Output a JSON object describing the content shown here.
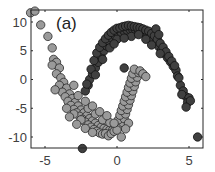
{
  "chart_data": {
    "type": "scatter",
    "title": "",
    "panel_label": "(a)",
    "xlabel": "",
    "ylabel": "",
    "xlim": [
      -6.0,
      6.0
    ],
    "ylim": [
      -12.0,
      12.3
    ],
    "xticks": [
      -5,
      0,
      5
    ],
    "xtick_labels": [
      "-5",
      "0",
      "5"
    ],
    "yticks": [
      -10,
      -5,
      0,
      5,
      10
    ],
    "ytick_labels": [
      "-10",
      "-5",
      "0",
      "5",
      "10"
    ],
    "grid": false,
    "legend": null,
    "marker": "circle",
    "series": [
      {
        "name": "class-1-light",
        "color": "#9a9a9a",
        "edgecolor": "#2a2a2a",
        "points": [
          [
            -6.0,
            11.6
          ],
          [
            -5.7,
            11.9
          ],
          [
            -5.3,
            9.5
          ],
          [
            -4.8,
            7.5
          ],
          [
            -4.5,
            5.5
          ],
          [
            -4.4,
            3.5
          ],
          [
            -4.2,
            3.0
          ],
          [
            -4.5,
            2.5
          ],
          [
            -4.0,
            2.0
          ],
          [
            -4.2,
            1.0
          ],
          [
            -3.9,
            0.3
          ],
          [
            -3.7,
            -0.5
          ],
          [
            -4.0,
            -1.0
          ],
          [
            -3.5,
            -1.5
          ],
          [
            -3.8,
            -2.2
          ],
          [
            -3.3,
            -2.5
          ],
          [
            -3.6,
            -3.0
          ],
          [
            -3.1,
            -3.3
          ],
          [
            -3.4,
            -3.8
          ],
          [
            -2.9,
            -4.0
          ],
          [
            -3.2,
            -4.5
          ],
          [
            -2.7,
            -4.6
          ],
          [
            -3.0,
            -5.2
          ],
          [
            -2.5,
            -5.3
          ],
          [
            -2.8,
            -5.8
          ],
          [
            -2.3,
            -5.8
          ],
          [
            -2.6,
            -6.4
          ],
          [
            -2.1,
            -6.3
          ],
          [
            -2.4,
            -6.9
          ],
          [
            -1.9,
            -6.8
          ],
          [
            -2.2,
            -7.4
          ],
          [
            -1.7,
            -7.2
          ],
          [
            -2.0,
            -7.9
          ],
          [
            -1.5,
            -7.6
          ],
          [
            -1.8,
            -8.3
          ],
          [
            -1.3,
            -8.0
          ],
          [
            -1.6,
            -8.7
          ],
          [
            -1.1,
            -8.3
          ],
          [
            -1.4,
            -9.0
          ],
          [
            -0.9,
            -8.5
          ],
          [
            -1.2,
            -9.3
          ],
          [
            -0.7,
            -8.7
          ],
          [
            -1.0,
            -9.5
          ],
          [
            -0.5,
            -8.8
          ],
          [
            -0.8,
            -9.4
          ],
          [
            -0.3,
            -8.8
          ],
          [
            -0.6,
            -9.8
          ],
          [
            -0.1,
            -8.6
          ],
          [
            -0.4,
            -9.4
          ],
          [
            0.1,
            -8.4
          ],
          [
            -0.2,
            -9.0
          ],
          [
            0.3,
            -8.0
          ],
          [
            0.0,
            -8.8
          ],
          [
            0.4,
            -7.5
          ],
          [
            0.1,
            -7.0
          ],
          [
            0.5,
            -6.8
          ],
          [
            0.2,
            -6.2
          ],
          [
            0.6,
            -6.0
          ],
          [
            0.3,
            -5.4
          ],
          [
            0.7,
            -5.2
          ],
          [
            0.4,
            -4.6
          ],
          [
            0.8,
            -4.4
          ],
          [
            0.5,
            -3.8
          ],
          [
            0.9,
            -3.6
          ],
          [
            0.6,
            -3.0
          ],
          [
            1.0,
            -2.8
          ],
          [
            0.7,
            -2.2
          ],
          [
            1.1,
            -2.0
          ],
          [
            0.8,
            -1.4
          ],
          [
            1.2,
            -1.2
          ],
          [
            0.9,
            -0.6
          ],
          [
            1.3,
            -0.4
          ],
          [
            1.0,
            0.2
          ],
          [
            1.4,
            0.4
          ],
          [
            1.1,
            1.0
          ],
          [
            1.5,
            1.2
          ],
          [
            1.2,
            1.8
          ],
          [
            1.6,
            1.5
          ],
          [
            1.8,
            1.0
          ],
          [
            2.0,
            0.5
          ],
          [
            0.3,
            -10.0
          ],
          [
            -3.0,
            -6.0
          ],
          [
            -2.0,
            -5.0
          ],
          [
            -1.5,
            -6.0
          ],
          [
            -1.0,
            -7.0
          ],
          [
            -0.5,
            -7.5
          ],
          [
            -2.5,
            -7.0
          ],
          [
            -3.5,
            -5.0
          ],
          [
            -2.2,
            -8.5
          ],
          [
            -1.7,
            -9.2
          ],
          [
            -2.8,
            -7.8
          ],
          [
            -3.3,
            -6.5
          ],
          [
            -0.2,
            -7.6
          ],
          [
            0.8,
            -7.6
          ],
          [
            0.6,
            -8.6
          ],
          [
            -4.3,
            -1.8
          ],
          [
            -3.0,
            -1.0
          ],
          [
            -2.7,
            -2.8
          ],
          [
            -2.2,
            -3.8
          ],
          [
            -1.7,
            -4.6
          ],
          [
            -1.2,
            -5.6
          ],
          [
            -0.7,
            -6.3
          ]
        ]
      },
      {
        "name": "class-2-dark",
        "color": "#404040",
        "edgecolor": "#111111",
        "points": [
          [
            -2.4,
            -12.0
          ],
          [
            5.6,
            -10.0
          ],
          [
            -2.0,
            -1.0
          ],
          [
            -2.2,
            -2.0
          ],
          [
            -1.9,
            0.0
          ],
          [
            -1.7,
            1.0
          ],
          [
            -1.5,
            2.0
          ],
          [
            -1.8,
            1.8
          ],
          [
            -1.3,
            3.0
          ],
          [
            -1.6,
            3.3
          ],
          [
            -1.1,
            4.0
          ],
          [
            -1.4,
            4.6
          ],
          [
            -0.9,
            5.0
          ],
          [
            -1.2,
            5.6
          ],
          [
            -0.7,
            5.8
          ],
          [
            -1.0,
            6.4
          ],
          [
            -0.5,
            6.5
          ],
          [
            -0.8,
            7.1
          ],
          [
            -0.3,
            7.1
          ],
          [
            -0.6,
            7.7
          ],
          [
            -0.1,
            7.5
          ],
          [
            -0.4,
            8.2
          ],
          [
            0.1,
            7.9
          ],
          [
            -0.2,
            8.6
          ],
          [
            0.3,
            8.2
          ],
          [
            0.0,
            8.9
          ],
          [
            0.5,
            8.4
          ],
          [
            0.2,
            9.0
          ],
          [
            0.7,
            8.6
          ],
          [
            0.4,
            9.2
          ],
          [
            0.9,
            8.7
          ],
          [
            0.6,
            9.3
          ],
          [
            1.1,
            8.7
          ],
          [
            0.8,
            9.4
          ],
          [
            1.3,
            8.6
          ],
          [
            1.0,
            9.3
          ],
          [
            1.5,
            8.5
          ],
          [
            1.2,
            9.2
          ],
          [
            1.7,
            8.3
          ],
          [
            1.4,
            9.1
          ],
          [
            1.9,
            8.0
          ],
          [
            1.6,
            9.0
          ],
          [
            2.1,
            7.7
          ],
          [
            1.8,
            8.8
          ],
          [
            2.3,
            7.3
          ],
          [
            2.0,
            8.6
          ],
          [
            2.5,
            6.8
          ],
          [
            2.2,
            8.4
          ],
          [
            2.7,
            6.3
          ],
          [
            2.4,
            8.0
          ],
          [
            2.9,
            5.7
          ],
          [
            2.6,
            7.6
          ],
          [
            3.1,
            5.1
          ],
          [
            2.8,
            7.0
          ],
          [
            3.3,
            4.5
          ],
          [
            3.0,
            6.3
          ],
          [
            3.5,
            3.8
          ],
          [
            3.2,
            5.6
          ],
          [
            3.7,
            3.1
          ],
          [
            3.4,
            4.8
          ],
          [
            3.9,
            2.3
          ],
          [
            3.6,
            4.0
          ],
          [
            4.1,
            1.6
          ],
          [
            3.8,
            3.2
          ],
          [
            4.2,
            0.6
          ],
          [
            4.0,
            2.4
          ],
          [
            4.4,
            -1.0
          ],
          [
            4.6,
            -2.0
          ],
          [
            4.8,
            -3.0
          ],
          [
            4.5,
            -2.6
          ],
          [
            5.0,
            -3.2
          ],
          [
            4.9,
            -4.0
          ],
          [
            5.1,
            -3.7
          ],
          [
            4.8,
            -4.8
          ],
          [
            2.7,
            8.8
          ],
          [
            2.9,
            7.8
          ],
          [
            0.0,
            7.0
          ],
          [
            1.0,
            7.5
          ],
          [
            2.0,
            7.0
          ],
          [
            -0.5,
            5.5
          ],
          [
            -1.0,
            3.5
          ],
          [
            3.0,
            4.5
          ],
          [
            0.5,
            7.2
          ],
          [
            1.5,
            7.8
          ],
          [
            -0.2,
            6.2
          ],
          [
            2.4,
            6.0
          ],
          [
            -1.5,
            0.8
          ],
          [
            -2.1,
            -0.8
          ],
          [
            4.3,
            0.3
          ],
          [
            0.5,
            2.0
          ]
        ]
      }
    ]
  }
}
